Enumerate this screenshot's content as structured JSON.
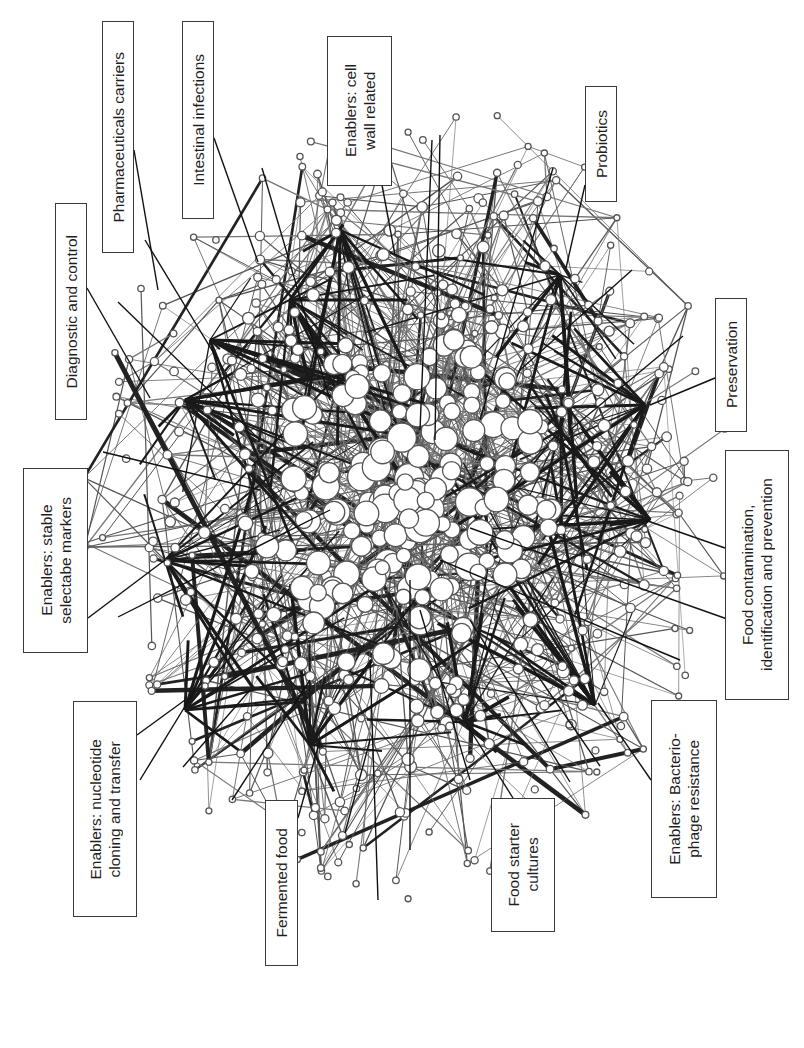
{
  "figure": {
    "type": "network-diagram",
    "orientation": "rotated-90",
    "background": "#ffffff",
    "node_stroke": "#555555",
    "edge_color": "#444444",
    "callout_border": "#3a3a3a"
  },
  "labels": [
    {
      "id": "pharmaceuticals-carriers",
      "text": "Pharmaceuticals carriers",
      "box": [
        102,
        21,
        32,
        232
      ],
      "pointer": [
        [
          134,
          210
        ],
        [
          160,
          300
        ]
      ],
      "leaders": [
        [
          134,
          150,
          158,
          290
        ],
        [
          145,
          240,
          230,
          380
        ]
      ]
    },
    {
      "id": "intestinal-infections",
      "text": "Intestinal infections",
      "box": [
        182,
        21,
        32,
        198
      ],
      "pointer": [
        [
          214,
          190
        ],
        [
          258,
          262
        ]
      ],
      "leaders": [
        [
          214,
          138,
          258,
          262
        ],
        [
          262,
          168,
          330,
          400
        ]
      ]
    },
    {
      "id": "cell-wall",
      "text": "Enablers: cell\nwall related",
      "box": [
        327,
        36,
        65,
        150
      ],
      "pointer": [
        [
          365,
          185
        ],
        [
          392,
          258
        ]
      ],
      "leaders": [
        [
          382,
          185,
          395,
          255
        ],
        [
          432,
          140,
          420,
          430
        ]
      ]
    },
    {
      "id": "probiotics",
      "text": "Probiotics",
      "box": [
        585,
        86,
        32,
        116
      ],
      "pointer": [
        [
          585,
          170
        ],
        [
          565,
          270
        ]
      ],
      "leaders": [
        [
          585,
          185,
          566,
          268
        ],
        [
          553,
          168,
          480,
          420
        ],
        [
          440,
          135,
          435,
          440
        ]
      ]
    },
    {
      "id": "diagnostic-control",
      "text": "Diagnostic and control",
      "box": [
        55,
        203,
        32,
        217
      ],
      "pointer": [
        [
          87,
          330
        ],
        [
          150,
          397
        ]
      ],
      "leaders": [
        [
          87,
          288,
          150,
          398
        ],
        [
          118,
          302,
          260,
          440
        ]
      ]
    },
    {
      "id": "preservation",
      "text": "Preservation",
      "box": [
        715,
        298,
        32,
        134
      ],
      "pointer": [
        [
          715,
          375
        ],
        [
          650,
          405
        ]
      ],
      "leaders": [
        [
          715,
          378,
          650,
          405
        ],
        [
          683,
          336,
          570,
          430
        ],
        [
          632,
          270,
          520,
          370
        ]
      ]
    },
    {
      "id": "stable-markers",
      "text": "Enablers: stable\nselectabe markers",
      "box": [
        23,
        468,
        65,
        185
      ],
      "pointer": [
        [
          88,
          575
        ],
        [
          165,
          560
        ]
      ],
      "leaders": [
        [
          88,
          618,
          165,
          560
        ],
        [
          118,
          617,
          330,
          510
        ],
        [
          103,
          452,
          260,
          490
        ]
      ]
    },
    {
      "id": "food-contamination",
      "text": "Food contamination,\nidentification and prevention",
      "box": [
        725,
        450,
        64,
        250
      ],
      "pointer": [
        [
          725,
          520
        ],
        [
          645,
          520
        ]
      ],
      "leaders": [
        [
          725,
          548,
          645,
          520
        ],
        [
          470,
          528,
          730,
          620
        ],
        [
          440,
          560,
          680,
          660
        ]
      ]
    },
    {
      "id": "nucleotide-cloning",
      "text": "Enablers: nucleotide\ncloning and transfer",
      "box": [
        73,
        701,
        64,
        216
      ],
      "pointer": [
        [
          137,
          780
        ],
        [
          185,
          700
        ]
      ],
      "leaders": [
        [
          137,
          735,
          185,
          700
        ],
        [
          140,
          780,
          195,
          690
        ],
        [
          183,
          767,
          250,
          690
        ],
        [
          232,
          800,
          310,
          680
        ]
      ]
    },
    {
      "id": "fermented-food",
      "text": "Fermented food",
      "box": [
        265,
        800,
        33,
        166
      ],
      "pointer": [
        [
          298,
          860
        ],
        [
          320,
          740
        ]
      ],
      "leaders": [
        [
          298,
          818,
          320,
          740
        ],
        [
          345,
          833,
          370,
          740
        ],
        [
          370,
          660,
          378,
          900
        ]
      ]
    },
    {
      "id": "food-starter-cultures",
      "text": "Food starter\ncultures",
      "box": [
        491,
        798,
        64,
        134
      ],
      "pointer": [
        [
          500,
          798
        ],
        [
          467,
          725
        ]
      ],
      "leaders": [
        [
          513,
          798,
          467,
          725
        ],
        [
          410,
          850,
          410,
          580
        ],
        [
          470,
          780,
          420,
          610
        ]
      ]
    },
    {
      "id": "bacteriophage-resistance",
      "text": "Enablers: Bacterio-\nphage resistance",
      "box": [
        651,
        700,
        66,
        198
      ],
      "pointer": [
        [
          651,
          780
        ],
        [
          598,
          703
        ]
      ],
      "leaders": [
        [
          651,
          780,
          598,
          703
        ],
        [
          600,
          766,
          520,
          650
        ],
        [
          570,
          782,
          470,
          620
        ]
      ]
    }
  ]
}
